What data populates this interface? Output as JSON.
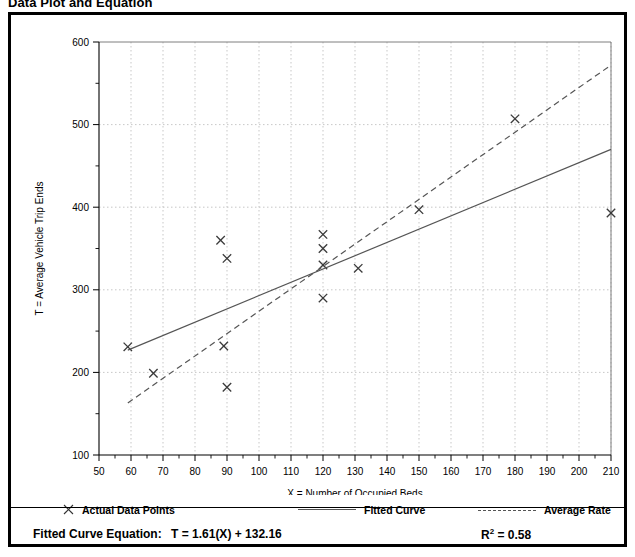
{
  "page": {
    "title": "Data Plot and Equation"
  },
  "legend": {
    "items": [
      {
        "label": "Actual Data Points",
        "marker": "x-marker-icon"
      },
      {
        "label": "Fitted Curve",
        "marker": "solid-line-icon"
      },
      {
        "label": "Average Rate",
        "marker": "dashed-line-icon"
      }
    ]
  },
  "equation": {
    "label": "Fitted Curve Equation:",
    "value": "T = 1.61(X) + 132.16",
    "r2_label": "R",
    "r2_sup": "2",
    "r2_value": "= 0.58"
  },
  "chart_data": {
    "type": "scatter",
    "title": "",
    "xlabel": "X = Number of Occupied Beds",
    "ylabel": "T = Average Vehicle Trip Ends",
    "xlim": [
      50,
      210
    ],
    "ylim": [
      100,
      600
    ],
    "xticks": [
      50,
      60,
      70,
      80,
      90,
      100,
      110,
      120,
      130,
      140,
      150,
      160,
      170,
      180,
      190,
      200,
      210
    ],
    "yticks": [
      100,
      200,
      300,
      400,
      500,
      600
    ],
    "y_minor_ticks": [
      150,
      250,
      350,
      450,
      550
    ],
    "grid": true,
    "legend_position": "below-plot",
    "series": [
      {
        "name": "Actual Data Points",
        "type": "scatter",
        "marker": "x",
        "points": [
          {
            "x": 59,
            "y": 231
          },
          {
            "x": 67,
            "y": 199
          },
          {
            "x": 88,
            "y": 360
          },
          {
            "x": 90,
            "y": 338
          },
          {
            "x": 89,
            "y": 232
          },
          {
            "x": 90,
            "y": 182
          },
          {
            "x": 120,
            "y": 367
          },
          {
            "x": 120,
            "y": 350
          },
          {
            "x": 120,
            "y": 330
          },
          {
            "x": 120,
            "y": 290
          },
          {
            "x": 131,
            "y": 326
          },
          {
            "x": 150,
            "y": 397
          },
          {
            "x": 180,
            "y": 507
          },
          {
            "x": 210,
            "y": 393
          }
        ]
      },
      {
        "name": "Fitted Curve",
        "type": "line",
        "style": "solid",
        "equation": "T = 1.61(X) + 132.16",
        "r_squared": 0.58,
        "endpoints": [
          {
            "x": 59,
            "y": 227
          },
          {
            "x": 210,
            "y": 470
          }
        ]
      },
      {
        "name": "Average Rate",
        "type": "line",
        "style": "dashed",
        "endpoints": [
          {
            "x": 59,
            "y": 163
          },
          {
            "x": 210,
            "y": 572
          }
        ]
      }
    ]
  }
}
